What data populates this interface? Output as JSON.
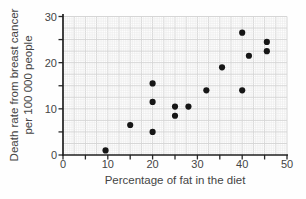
{
  "figure": {
    "background": "#fefefe",
    "axis_color": "#1f1f1f",
    "tick_color": "#2a2a2a",
    "grid_minor_color": "#ebebeb",
    "grid_major_color": "#d6d6d6",
    "point_color": "#161616",
    "label_color": "#454545"
  },
  "chart_data": {
    "type": "scatter",
    "title": "",
    "xlabel": "Percentage of fat in the diet",
    "ylabel": "Death rate from breast cancer per 100 000 people",
    "ylabel_line1": "Death rate from breast cancer",
    "ylabel_line2": "per 100 000 people",
    "xlim": [
      0,
      50
    ],
    "ylim": [
      0,
      30
    ],
    "xtick_labels": [
      "0",
      "10",
      "20",
      "30",
      "40",
      "50"
    ],
    "ytick_labels": [
      "0",
      "10",
      "20",
      "30"
    ],
    "tick_step": 5,
    "label_step": 10,
    "grid": "fine graph-paper grid, bold line every 2.5 units",
    "legend": "none",
    "points": [
      [
        9.5,
        1
      ],
      [
        15,
        6.5
      ],
      [
        20,
        5
      ],
      [
        20,
        11.5
      ],
      [
        20,
        15.5
      ],
      [
        25,
        8.5
      ],
      [
        25,
        10.5
      ],
      [
        28,
        10.5
      ],
      [
        32,
        14
      ],
      [
        35.5,
        19
      ],
      [
        40,
        14
      ],
      [
        40,
        26.5
      ],
      [
        41.5,
        21.5
      ],
      [
        45.5,
        22.5
      ],
      [
        45.5,
        24.5
      ]
    ]
  }
}
